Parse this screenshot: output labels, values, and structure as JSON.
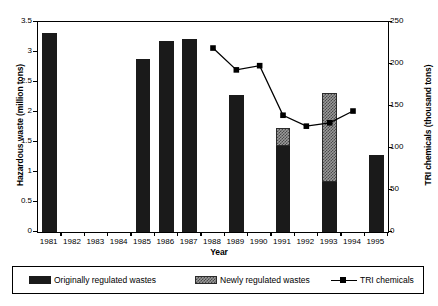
{
  "chart_data": {
    "type": "bar",
    "title": "",
    "xlabel": "Year",
    "ylabel": "Hazardous waste (million tons)",
    "ylabel_right": "TRI chemicals (thousand tons)",
    "categories": [
      "1981",
      "1982",
      "1983",
      "1984",
      "1985",
      "1986",
      "1987",
      "1988",
      "1989",
      "1990",
      "1991",
      "1992",
      "1993",
      "1994",
      "1995"
    ],
    "ylim": [
      0,
      3.5
    ],
    "yticks": [
      "0",
      "0.5",
      "1",
      "1.5",
      "2",
      "2.5",
      "3",
      "3.5"
    ],
    "ytick_values": [
      0,
      0.5,
      1,
      1.5,
      2,
      2.5,
      3,
      3.5
    ],
    "ylim_right": [
      0,
      250
    ],
    "yticks_right": [
      "0",
      "50",
      "100",
      "150",
      "200",
      "250"
    ],
    "ytick_values_right": [
      0,
      50,
      100,
      150,
      200,
      250
    ],
    "grid": false,
    "legend_position": "below",
    "series": [
      {
        "name": "Originally regulated wastes",
        "axis": "left",
        "kind": "bar",
        "color": "#1a1a1a",
        "values": [
          3.31,
          null,
          null,
          null,
          2.88,
          3.19,
          3.22,
          null,
          2.29,
          null,
          1.44,
          null,
          0.84,
          null,
          1.28
        ]
      },
      {
        "name": "Newly regulated wastes",
        "axis": "left",
        "kind": "bar",
        "color": "#9a9a9a",
        "values": [
          null,
          null,
          null,
          null,
          null,
          null,
          null,
          null,
          null,
          null,
          0.29,
          null,
          1.48,
          null,
          null
        ]
      },
      {
        "name": "TRI chemicals",
        "axis": "right",
        "kind": "line",
        "color": "#000000",
        "values": [
          null,
          null,
          null,
          null,
          null,
          null,
          null,
          219,
          193,
          198,
          139,
          126,
          130,
          144,
          null
        ]
      }
    ]
  },
  "legend": {
    "items": [
      {
        "label": "Originally regulated wastes",
        "marker": "filled-square-black"
      },
      {
        "label": "Newly regulated wastes",
        "marker": "filled-square-gray-hatch"
      },
      {
        "label": "TRI chemicals",
        "marker": "line-with-square-marker"
      }
    ]
  }
}
